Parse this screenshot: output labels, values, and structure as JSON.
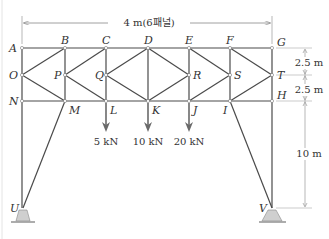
{
  "colors": {
    "member": "#4a4a4a",
    "arrow": "#6a6a6a",
    "support_fill": "#cfcfcf",
    "dimension": "#888888",
    "text": "#333333"
  },
  "dimensions": {
    "span": "4 m(6패널)",
    "upper_height": "2.5 m",
    "lower_height": "2.5 m",
    "leg_height": "10 m"
  },
  "nodes": {
    "A": "A",
    "B": "B",
    "C": "C",
    "D": "D",
    "E": "E",
    "F": "F",
    "G": "G",
    "O": "O",
    "P": "P",
    "Q": "Q",
    "R": "R",
    "S": "S",
    "T": "T",
    "N": "N",
    "M": "M",
    "L": "L",
    "K": "K",
    "J": "J",
    "I": "I",
    "H": "H",
    "U": "U",
    "V": "V"
  },
  "loads": [
    {
      "node": "L",
      "label": "5 kN"
    },
    {
      "node": "K",
      "label": "10 kN"
    },
    {
      "node": "J",
      "label": "20 kN"
    }
  ]
}
